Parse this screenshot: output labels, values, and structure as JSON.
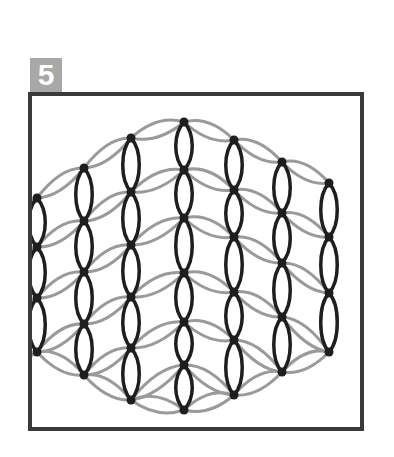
{
  "step": {
    "number": "5"
  },
  "colors": {
    "frame": "#3a3a3a",
    "badge_bg": "#a8a8a8",
    "badge_text": "#ffffff",
    "knit_stitch": "#1e1e1e",
    "purl_strand": "#9a9a9a"
  },
  "diagram": {
    "columns": [
      {
        "x": 37,
        "nodes": [
          198,
          247,
          298,
          352
        ]
      },
      {
        "x": 84,
        "nodes": [
          168,
          221,
          272,
          324,
          375
        ]
      },
      {
        "x": 131,
        "nodes": [
          138,
          192,
          245,
          297,
          348,
          400
        ]
      },
      {
        "x": 184,
        "nodes": [
          122,
          170,
          218,
          273,
          322,
          365,
          410
        ]
      },
      {
        "x": 234,
        "nodes": [
          140,
          190,
          237,
          292,
          340,
          395
        ]
      },
      {
        "x": 282,
        "nodes": [
          162,
          213,
          263,
          317,
          372
        ]
      },
      {
        "x": 329,
        "nodes": [
          183,
          237,
          293,
          352
        ]
      }
    ]
  }
}
